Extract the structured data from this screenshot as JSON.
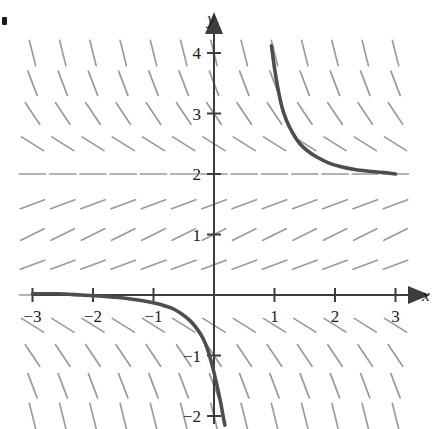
{
  "figure": {
    "corner_mark": "bullet"
  },
  "axes": {
    "x_label": "x",
    "y_label": "y",
    "x_ticks": [
      {
        "value": -3,
        "label": "−3"
      },
      {
        "value": -2,
        "label": "−2"
      },
      {
        "value": -1,
        "label": "−1"
      },
      {
        "value": 1,
        "label": "1"
      },
      {
        "value": 2,
        "label": "2"
      },
      {
        "value": 3,
        "label": "3"
      }
    ],
    "y_ticks": [
      {
        "value": -2,
        "label": "−2"
      },
      {
        "value": -1,
        "label": "−1"
      },
      {
        "value": 1,
        "label": "1"
      },
      {
        "value": 2,
        "label": "2"
      },
      {
        "value": 3,
        "label": "3"
      },
      {
        "value": 4,
        "label": "4"
      }
    ]
  },
  "colors": {
    "axis": "#3d3d3d",
    "slope_mark": "#9a9a9a",
    "curve": "#4d4d4d",
    "label": "#1a1a1a",
    "background": "#ffffff"
  },
  "chart_data": {
    "type": "line",
    "xlabel": "x",
    "ylabel": "y",
    "xlim": [
      -3.45,
      3.75
    ],
    "ylim": [
      -2.2,
      4.35
    ],
    "grid": false,
    "legend": "none",
    "xticks": [
      -3,
      -2,
      -1,
      1,
      2,
      3
    ],
    "yticks": [
      -2,
      -1,
      1,
      2,
      3,
      4
    ],
    "slope_field": {
      "description": "Direction field; segments horizontal at y=0 and y=2, positive slopes for 0<y<2, steep negative slopes for y<0 and y>2",
      "x_start": -3.0,
      "x_end": 3.25,
      "x_step": 0.5,
      "y_start": -2.0,
      "y_end": 4.25,
      "y_step": 0.5,
      "segment_length_px": 26,
      "slope_formula": "y*(2-y)/2"
    },
    "series": [
      {
        "name": "upper solution curve",
        "comment": "decays from near (0.95, 4.1) toward the asymptote y=2",
        "x": [
          0.95,
          1.0,
          1.05,
          1.12,
          1.2,
          1.3,
          1.42,
          1.55,
          1.7,
          1.9,
          2.1,
          2.35,
          2.6,
          2.85,
          3.0
        ],
        "y": [
          4.12,
          3.75,
          3.45,
          3.12,
          2.88,
          2.68,
          2.5,
          2.38,
          2.28,
          2.18,
          2.12,
          2.07,
          2.04,
          2.02,
          2.0
        ]
      },
      {
        "name": "lower solution curve",
        "comment": "leaves the asymptote y=0 on the left and plunges through y=-2 near x=0.18",
        "x": [
          -3.0,
          -2.6,
          -2.2,
          -1.85,
          -1.5,
          -1.2,
          -0.95,
          -0.72,
          -0.55,
          -0.4,
          -0.28,
          -0.18,
          -0.1,
          -0.02,
          0.05,
          0.11,
          0.15,
          0.18
        ],
        "y": [
          0.02,
          0.02,
          0.0,
          -0.02,
          -0.05,
          -0.09,
          -0.14,
          -0.21,
          -0.3,
          -0.42,
          -0.56,
          -0.72,
          -0.92,
          -1.2,
          -1.5,
          -1.78,
          -2.0,
          -2.15
        ]
      }
    ],
    "asymptotes": [
      {
        "type": "horizontal",
        "value": 2,
        "note": "stable equilibrium"
      },
      {
        "type": "horizontal",
        "value": 0,
        "note": "unstable equilibrium"
      }
    ]
  }
}
